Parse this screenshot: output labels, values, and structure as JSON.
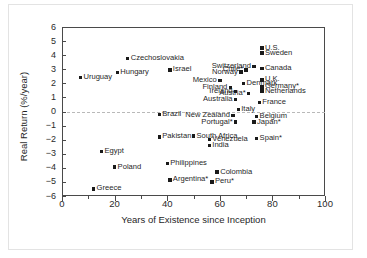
{
  "chart_data": {
    "type": "scatter",
    "title": "",
    "xlabel": "Years of Existence since Inception",
    "ylabel": "Real Return (%/year)",
    "xlim": [
      0,
      100
    ],
    "ylim": [
      -6,
      6
    ],
    "xticks": [
      0,
      20,
      40,
      60,
      80,
      100
    ],
    "xticks_minor": [
      10,
      30,
      50,
      70,
      90
    ],
    "yticks": [
      6,
      5,
      4,
      3,
      2,
      1,
      0,
      -1,
      -2,
      -3,
      -4,
      -5,
      -6
    ],
    "ytick_labels": [
      "6",
      "5",
      "4",
      "3",
      "2",
      "1",
      "0",
      "-1",
      "-2",
      "-3",
      "-4",
      "-5",
      "-6"
    ],
    "grid": false,
    "zero_reference_line": true,
    "legend": "none",
    "marker": "square",
    "marker_color": "#1a1a1a",
    "points": [
      {
        "label": "Uruguay",
        "x": 7,
        "y": 2.4,
        "side": "right"
      },
      {
        "label": "Hungary",
        "x": 21,
        "y": 2.75,
        "side": "right"
      },
      {
        "label": "Czechoslovakia",
        "x": 25,
        "y": 3.75,
        "side": "right"
      },
      {
        "label": "Israel",
        "x": 41,
        "y": 2.95,
        "side": "right"
      },
      {
        "label": "Mexico",
        "x": 60,
        "y": 2.2,
        "side": "left"
      },
      {
        "label": "Norway",
        "x": 68,
        "y": 2.8,
        "side": "left"
      },
      {
        "label": "Chile*",
        "x": 70,
        "y": 2.95,
        "side": "left"
      },
      {
        "label": "Switzerland",
        "x": 73,
        "y": 3.2,
        "side": "left"
      },
      {
        "label": "U.S.",
        "x": 76,
        "y": 4.5,
        "side": "right"
      },
      {
        "label": "Sweden",
        "x": 76,
        "y": 4.15,
        "side": "right"
      },
      {
        "label": "Canada",
        "x": 76,
        "y": 3.05,
        "side": "right"
      },
      {
        "label": "U.K.",
        "x": 76,
        "y": 2.25,
        "side": "right"
      },
      {
        "label": "Denmark",
        "x": 69,
        "y": 2.0,
        "side": "right"
      },
      {
        "label": "Finland",
        "x": 64,
        "y": 1.7,
        "side": "left"
      },
      {
        "label": "Germany*",
        "x": 76,
        "y": 1.75,
        "side": "right"
      },
      {
        "label": "Ireland",
        "x": 66,
        "y": 1.4,
        "side": "left"
      },
      {
        "label": "Austria*",
        "x": 71,
        "y": 1.3,
        "side": "left"
      },
      {
        "label": "Netherlands",
        "x": 76,
        "y": 1.45,
        "side": "right"
      },
      {
        "label": "Australia",
        "x": 66,
        "y": 0.85,
        "side": "left"
      },
      {
        "label": "France",
        "x": 75,
        "y": 0.65,
        "side": "right"
      },
      {
        "label": "Italy",
        "x": 67,
        "y": 0.15,
        "side": "right"
      },
      {
        "label": "Brazil",
        "x": 37,
        "y": -0.2,
        "side": "right"
      },
      {
        "label": "New Zealand",
        "x": 65,
        "y": -0.3,
        "side": "left"
      },
      {
        "label": "Belgium",
        "x": 74,
        "y": -0.35,
        "side": "right"
      },
      {
        "label": "Portugal*",
        "x": 66,
        "y": -0.75,
        "side": "left"
      },
      {
        "label": "Japan*",
        "x": 73,
        "y": -0.75,
        "side": "right"
      },
      {
        "label": "Pakistan",
        "x": 37,
        "y": -1.8,
        "side": "right"
      },
      {
        "label": "South Africa",
        "x": 50,
        "y": -1.75,
        "side": "right"
      },
      {
        "label": "Venezuela",
        "x": 56,
        "y": -2.0,
        "side": "right"
      },
      {
        "label": "Spain*",
        "x": 74,
        "y": -1.9,
        "side": "right"
      },
      {
        "label": "India",
        "x": 56,
        "y": -2.4,
        "side": "right"
      },
      {
        "label": "Egypt",
        "x": 15,
        "y": -2.85,
        "side": "right"
      },
      {
        "label": "Philippines",
        "x": 40,
        "y": -3.7,
        "side": "right"
      },
      {
        "label": "Poland",
        "x": 20,
        "y": -3.95,
        "side": "right"
      },
      {
        "label": "Colombia",
        "x": 59,
        "y": -4.3,
        "side": "right"
      },
      {
        "label": "Argentina*",
        "x": 41,
        "y": -4.85,
        "side": "right"
      },
      {
        "label": "Peru*",
        "x": 57,
        "y": -5.0,
        "side": "right"
      },
      {
        "label": "Greece",
        "x": 12,
        "y": -5.5,
        "side": "right"
      }
    ]
  }
}
